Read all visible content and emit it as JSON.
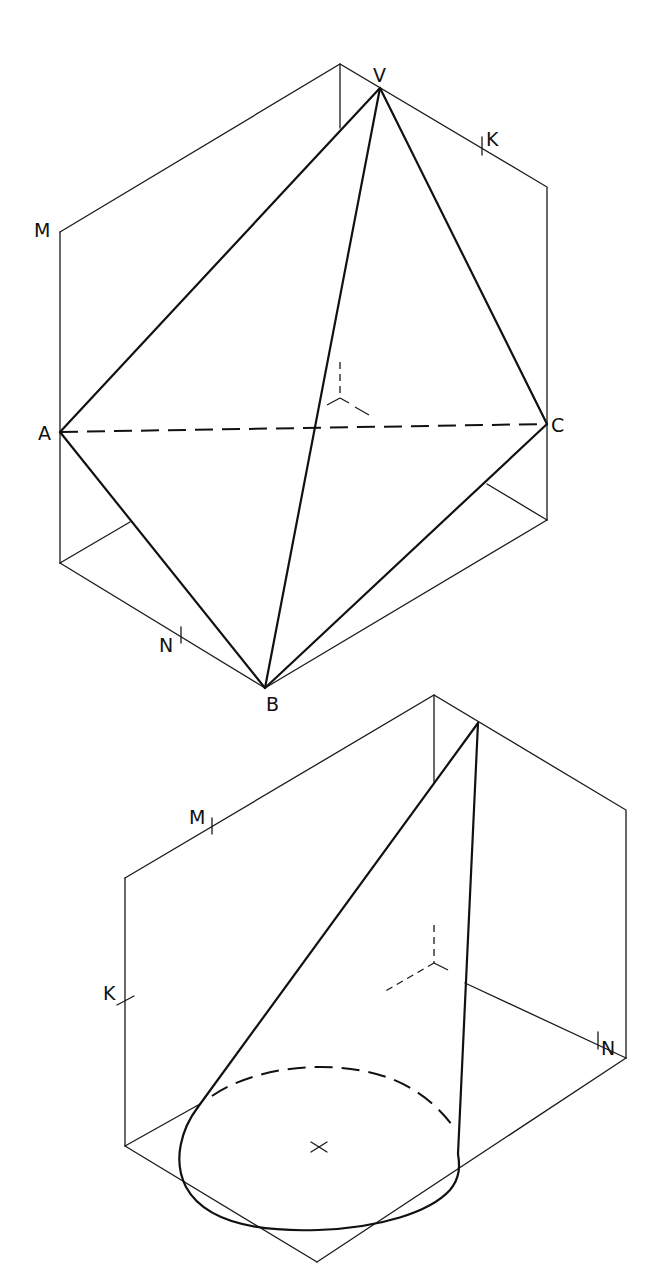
{
  "figure_top": {
    "description": "Triangular pyramid V-ABC inscribed in isometric box",
    "vertex_labels": {
      "V": "V",
      "A": "A",
      "B": "B",
      "C": "C"
    },
    "edge_marks": {
      "M": "M",
      "K": "K",
      "N": "N"
    }
  },
  "figure_bottom": {
    "description": "Oblique cone in isometric box",
    "edge_marks": {
      "M": "M",
      "K": "K",
      "N": "N"
    }
  },
  "colors": {
    "ink": "#111111",
    "background": "#ffffff"
  }
}
